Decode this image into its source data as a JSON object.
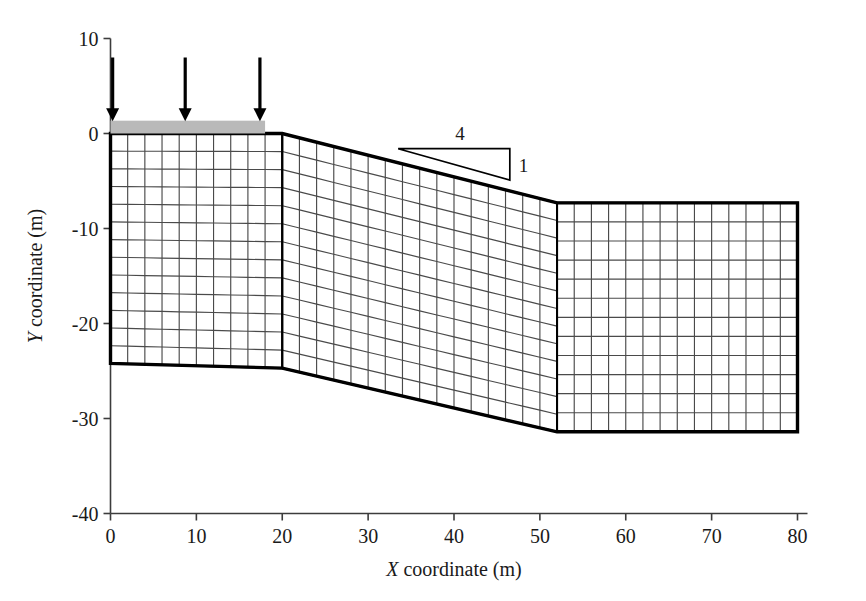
{
  "figure": {
    "type": "finite-element-mesh-slope-diagram",
    "background_color": "#ffffff",
    "line_color": "#1a1a1a",
    "mesh_line_color": "#4a4a4a",
    "outline_color": "#000000",
    "load_strip_color": "#b9b9b9"
  },
  "axes": {
    "x": {
      "title_italic": "X",
      "title_rest": " coordinate (m)",
      "title_full": "X coordinate (m)",
      "min": 0,
      "max": 80,
      "tick_step": 10,
      "ticks": [
        "0",
        "10",
        "20",
        "30",
        "40",
        "50",
        "60",
        "70",
        "80"
      ],
      "tick_values": [
        0,
        10,
        20,
        30,
        40,
        50,
        60,
        70,
        80
      ]
    },
    "y": {
      "title_italic": "Y",
      "title_rest": " coordinate (m)",
      "title_full": "Y coordinate (m)",
      "min": -40,
      "max": 10,
      "tick_step": 10,
      "ticks": [
        "10",
        "0",
        "-10",
        "-20",
        "-30",
        "-40"
      ],
      "tick_values": [
        10,
        0,
        -10,
        -20,
        -30,
        -40
      ]
    }
  },
  "annotations": {
    "slope_ratio": {
      "horizontal_label": "4",
      "vertical_label": "1",
      "meaning": "4:1 horizontal to vertical slope",
      "triangle_x_start": 33.5,
      "triangle_x_end": 46.5,
      "triangle_y_top": -1.6,
      "triangle_y_bottom": -4.9
    },
    "load_strip": {
      "x_start": 0,
      "x_end": 18,
      "y_top": 1.35,
      "y_bottom": 0
    },
    "load_arrows": {
      "count": 3,
      "x_positions": [
        0.25,
        8.7,
        17.4
      ],
      "y_tail": 8.0,
      "y_head": 1.3,
      "direction": "down"
    }
  },
  "chart_data": {
    "type": "mesh",
    "title": "",
    "xlabel": "X coordinate (m)",
    "ylabel": "Y coordinate (m)",
    "xlim": [
      0,
      80
    ],
    "ylim": [
      -40,
      10
    ],
    "grid": false,
    "legend": null,
    "geometry": {
      "crest_point": [
        20,
        0
      ],
      "toe_point": [
        52,
        -7.3
      ],
      "left_top_left": [
        0,
        0
      ],
      "left_bottom_left": [
        0,
        -24.2
      ],
      "left_bottom_right": [
        20,
        -24.7
      ],
      "right_top_right": [
        80,
        -7.3
      ],
      "right_bottom_right": [
        80,
        -31.4
      ],
      "mid_bottom_right": [
        52,
        -31.4
      ]
    },
    "blocks": [
      {
        "name": "left-block",
        "cols": 10,
        "rows": 13,
        "corners_xy": [
          [
            0,
            0
          ],
          [
            20,
            0
          ],
          [
            20,
            -24.7
          ],
          [
            0,
            -24.2
          ]
        ]
      },
      {
        "name": "slope-block",
        "cols": 16,
        "rows": 13,
        "corners_xy": [
          [
            20,
            0
          ],
          [
            52,
            -7.3
          ],
          [
            52,
            -31.4
          ],
          [
            20,
            -24.7
          ]
        ]
      },
      {
        "name": "right-block",
        "cols": 14,
        "rows": 12,
        "corners_xy": [
          [
            52,
            -7.3
          ],
          [
            80,
            -7.3
          ],
          [
            80,
            -31.4
          ],
          [
            52,
            -31.4
          ]
        ]
      }
    ]
  }
}
